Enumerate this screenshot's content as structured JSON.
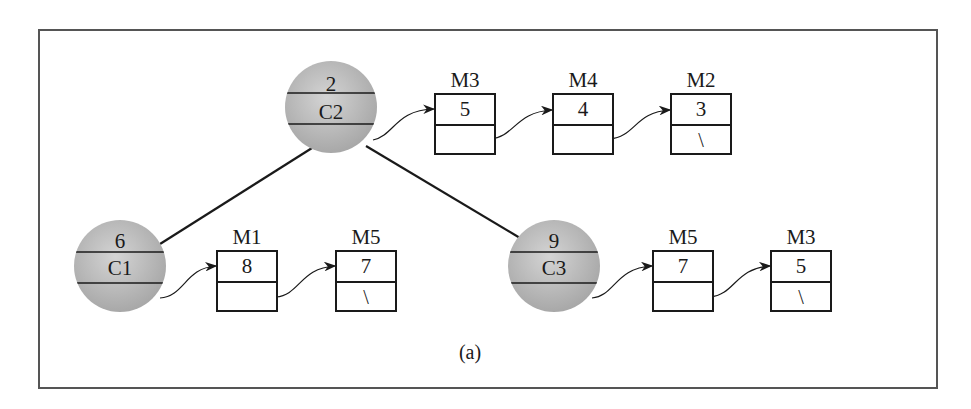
{
  "diagram": {
    "caption": "(a)",
    "nodes": [
      {
        "id": "C2",
        "key": "2",
        "name": "C2",
        "list": [
          {
            "label": "M3",
            "value": "5",
            "next": ""
          },
          {
            "label": "M4",
            "value": "4",
            "next": ""
          },
          {
            "label": "M2",
            "value": "3",
            "next": "\\"
          }
        ]
      },
      {
        "id": "C1",
        "key": "6",
        "name": "C1",
        "list": [
          {
            "label": "M1",
            "value": "8",
            "next": ""
          },
          {
            "label": "M5",
            "value": "7",
            "next": "\\"
          }
        ]
      },
      {
        "id": "C3",
        "key": "9",
        "name": "C3",
        "list": [
          {
            "label": "M5",
            "value": "7",
            "next": ""
          },
          {
            "label": "M3",
            "value": "5",
            "next": "\\"
          }
        ]
      }
    ],
    "edges": [
      {
        "from": "C2",
        "to": "C1"
      },
      {
        "from": "C2",
        "to": "C3"
      }
    ],
    "colors": {
      "node_fill": "#b8b8b8",
      "stroke": "#1a1a1a",
      "frame": "#555555"
    }
  }
}
